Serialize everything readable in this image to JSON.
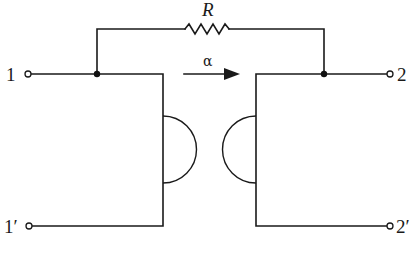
{
  "diagram": {
    "labels": {
      "resistor": "R",
      "arrow": "α",
      "port1_top": "1",
      "port1_bottom": "1′",
      "port2_top": "2",
      "port2_bottom": "2′"
    },
    "components": [
      {
        "type": "resistor",
        "label": "R",
        "connects": [
          "node-left",
          "node-right"
        ]
      },
      {
        "type": "semicircle-element",
        "side": "left",
        "orientation": "bulges-right"
      },
      {
        "type": "semicircle-element",
        "side": "right",
        "orientation": "bulges-left"
      },
      {
        "type": "arrow",
        "label": "α",
        "direction": "left-to-right"
      }
    ],
    "terminals": [
      "1",
      "1′",
      "2",
      "2′"
    ],
    "colors": {
      "line": "#1a1a1a",
      "background": "#ffffff"
    }
  }
}
